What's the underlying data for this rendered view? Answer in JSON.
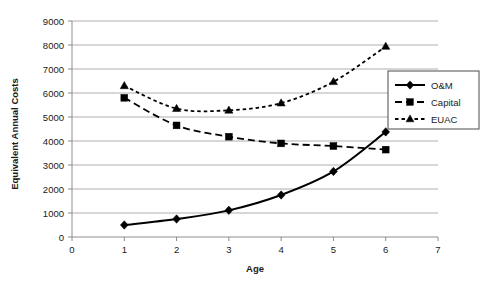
{
  "chart_data": {
    "type": "line",
    "title": "",
    "xlabel": "Age",
    "ylabel": "Equivalent Annual Costs",
    "x": [
      1,
      2,
      3,
      4,
      5,
      6
    ],
    "xlim": [
      0,
      7
    ],
    "ylim": [
      0,
      9000
    ],
    "xticks": [
      0,
      1,
      2,
      3,
      4,
      5,
      6,
      7
    ],
    "yticks": [
      0,
      1000,
      2000,
      3000,
      4000,
      5000,
      6000,
      7000,
      8000,
      9000
    ],
    "grid": "horizontal",
    "legend_position": "right",
    "series": [
      {
        "name": "O&M",
        "values": [
          500,
          750,
          1110,
          1750,
          2730,
          4380
        ],
        "marker": "diamond",
        "linestyle": "solid",
        "color": "#000000"
      },
      {
        "name": "Capital",
        "values": [
          5800,
          4650,
          4180,
          3900,
          3790,
          3640
        ],
        "marker": "square",
        "linestyle": "dashed",
        "color": "#000000"
      },
      {
        "name": "EUAC",
        "values": [
          6300,
          5350,
          5280,
          5580,
          6470,
          7940
        ],
        "marker": "triangle",
        "linestyle": "dotted",
        "color": "#000000"
      }
    ]
  },
  "axes": {
    "x_title": "Age",
    "y_title": "Equivalent Annual Costs",
    "x_tick_labels": [
      "0",
      "1",
      "2",
      "3",
      "4",
      "5",
      "6",
      "7"
    ],
    "y_tick_labels": [
      "0",
      "1000",
      "2000",
      "3000",
      "4000",
      "5000",
      "6000",
      "7000",
      "8000",
      "9000"
    ]
  },
  "legend": {
    "entries": [
      {
        "label": "O&M",
        "marker": "diamond",
        "linestyle": "solid"
      },
      {
        "label": "Capital",
        "marker": "square",
        "linestyle": "dashed"
      },
      {
        "label": "EUAC",
        "marker": "triangle",
        "linestyle": "dotted"
      }
    ]
  }
}
